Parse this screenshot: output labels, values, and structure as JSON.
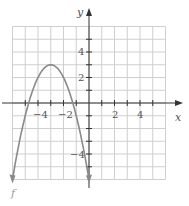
{
  "chart_data": {
    "type": "line",
    "title": "",
    "xlabel": "x",
    "ylabel": "y",
    "function_label": "f",
    "function": "f(x) = -(x+3)^2 + 3",
    "vertex": [
      -3,
      3
    ],
    "x_intercepts": [
      -4.73,
      -1.27
    ],
    "endpoints": [
      [
        -6,
        -6
      ],
      [
        0,
        -6
      ]
    ],
    "xlim": [
      -6,
      6
    ],
    "ylim": [
      -6,
      6
    ],
    "grid": true,
    "x_ticks": [
      -4,
      -2,
      2,
      4
    ],
    "y_ticks": [
      4,
      2,
      -4
    ],
    "x_tick_labels": [
      "−4",
      "−2",
      "2",
      "4"
    ],
    "y_tick_labels": [
      "4",
      "2",
      "−4"
    ],
    "points": [
      [
        -6,
        -6
      ],
      [
        -5.5,
        -3.25
      ],
      [
        -5,
        -1
      ],
      [
        -4.5,
        0.75
      ],
      [
        -4,
        2
      ],
      [
        -3.5,
        2.75
      ],
      [
        -3,
        3
      ],
      [
        -2.5,
        2.75
      ],
      [
        -2,
        2
      ],
      [
        -1.5,
        0.75
      ],
      [
        -1,
        -1
      ],
      [
        -0.5,
        -3.25
      ],
      [
        0,
        -6
      ]
    ],
    "colors": {
      "curve": "#8a8a8a",
      "grid": "#cfcfcf",
      "axis": "#333333"
    }
  }
}
